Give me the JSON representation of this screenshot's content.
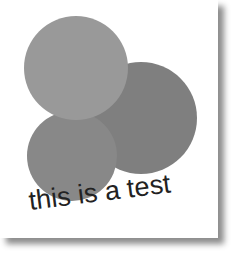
{
  "caption": "this is a test",
  "circles": [
    {
      "name": "right",
      "cx": 141,
      "cy": 118,
      "r": 56,
      "color": "#7f7f7f"
    },
    {
      "name": "bottom-left",
      "cx": 72,
      "cy": 156,
      "r": 45,
      "color": "#888888"
    },
    {
      "name": "top",
      "cx": 76,
      "cy": 68,
      "r": 52,
      "color": "#999999"
    }
  ],
  "colors": {
    "text": "#222222",
    "page": "#ffffff"
  }
}
